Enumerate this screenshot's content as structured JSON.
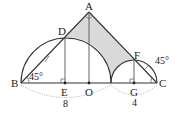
{
  "diagram": {
    "points": {
      "A": "A",
      "B": "B",
      "C": "C",
      "D": "D",
      "E": "E",
      "F": "F",
      "G": "G",
      "O": "O"
    },
    "angles": {
      "B": "45°",
      "C": "45°"
    },
    "lengths": {
      "BE_span": "8",
      "GC_span": "4"
    },
    "colors": {
      "shaded": "#d9d9d9",
      "line": "#333333",
      "dotted": "#9a9a9a"
    }
  }
}
